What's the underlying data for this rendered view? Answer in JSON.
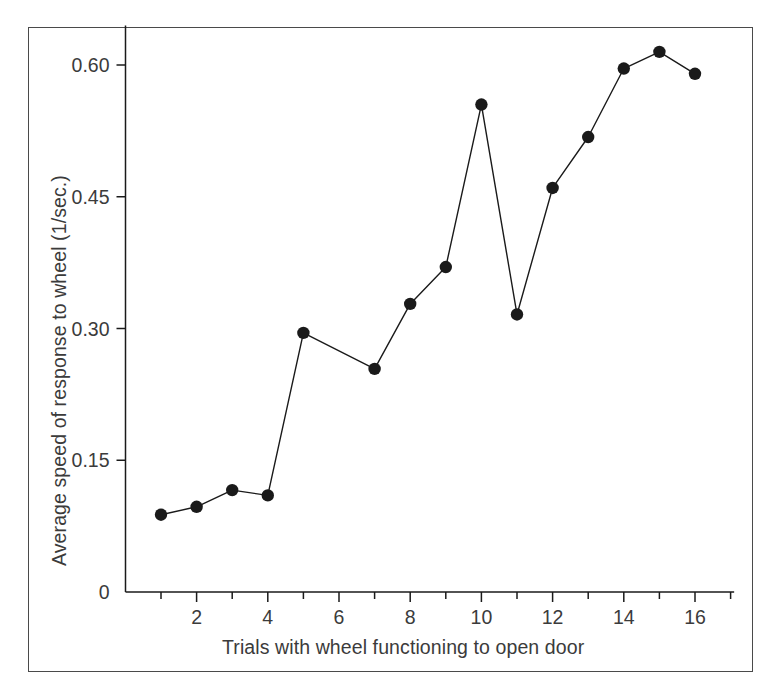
{
  "figure": {
    "border_color": "#4a4a4a",
    "background": "#ffffff",
    "ink_color": "#1a1a1a",
    "text_color": "#3b3b3b"
  },
  "chart_data": {
    "type": "line",
    "title": "",
    "xlabel": "Trials with wheel functioning to open door",
    "ylabel": "Average speed of response to wheel (1/sec.)",
    "x": [
      1,
      2,
      3,
      4,
      5,
      7,
      8,
      9,
      10,
      11,
      12,
      13,
      14,
      15,
      16
    ],
    "values": [
      0.088,
      0.097,
      0.116,
      0.11,
      0.295,
      0.254,
      0.328,
      0.37,
      0.555,
      0.316,
      0.46,
      0.518,
      0.596,
      0.615,
      0.59
    ],
    "series": [
      {
        "name": "Average speed of response to wheel",
        "points": [
          {
            "x": 1,
            "y": 0.088
          },
          {
            "x": 2,
            "y": 0.097
          },
          {
            "x": 3,
            "y": 0.116
          },
          {
            "x": 4,
            "y": 0.11
          },
          {
            "x": 5,
            "y": 0.295
          },
          {
            "x": 7,
            "y": 0.254
          },
          {
            "x": 8,
            "y": 0.328
          },
          {
            "x": 9,
            "y": 0.37
          },
          {
            "x": 10,
            "y": 0.555
          },
          {
            "x": 11,
            "y": 0.316
          },
          {
            "x": 12,
            "y": 0.46
          },
          {
            "x": 13,
            "y": 0.518
          },
          {
            "x": 14,
            "y": 0.596
          },
          {
            "x": 15,
            "y": 0.615
          },
          {
            "x": 16,
            "y": 0.59
          }
        ],
        "marker": "filled-circle",
        "marker_color": "#1a1a1a",
        "line_color": "#1a1a1a",
        "line_width": 1.4,
        "marker_radius": 6.2
      }
    ],
    "xlim": [
      0.35,
      17.1
    ],
    "ylim": [
      0,
      0.645
    ],
    "x_major_ticks": [
      2,
      4,
      6,
      8,
      10,
      12,
      14,
      16
    ],
    "x_minor_ticks": [
      1,
      3,
      5,
      7,
      9,
      11,
      13,
      15,
      17
    ],
    "x_tick_labels": [
      "2",
      "4",
      "6",
      "8",
      "10",
      "12",
      "14",
      "16"
    ],
    "y_ticks": [
      0,
      0.15,
      0.3,
      0.45,
      0.6
    ],
    "y_tick_labels": [
      "0",
      "0.15",
      "0.30",
      "0.45",
      "0.60"
    ],
    "grid": false,
    "legend": "none",
    "annotations": []
  }
}
